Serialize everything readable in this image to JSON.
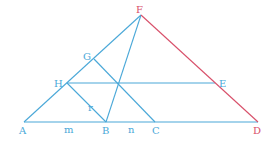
{
  "diagram": {
    "colors": {
      "blue": "#4aa8d8",
      "red": "#d8506a"
    },
    "points": {
      "F": {
        "label": "F",
        "x": 141,
        "y": 15
      },
      "A": {
        "label": "A",
        "x": 24,
        "y": 122
      },
      "B": {
        "label": "B",
        "x": 106,
        "y": 122
      },
      "C": {
        "label": "C",
        "x": 155,
        "y": 122
      },
      "D": {
        "label": "D",
        "x": 258,
        "y": 122
      },
      "H": {
        "label": "H",
        "x": 67,
        "y": 83
      },
      "G": {
        "label": "G",
        "x": 94,
        "y": 59
      },
      "E": {
        "label": "E",
        "x": 215,
        "y": 83
      }
    },
    "segment_labels": {
      "r": "r",
      "m": "m",
      "n": "n"
    }
  }
}
